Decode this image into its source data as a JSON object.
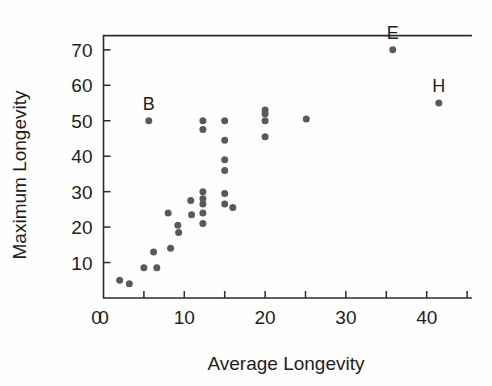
{
  "chart_data": {
    "type": "scatter",
    "title": "",
    "xlabel": "Average Longevity",
    "ylabel": "Maximum Longevity",
    "xlim": [
      0,
      45.5
    ],
    "ylim": [
      0,
      74
    ],
    "grid": false,
    "legend": null,
    "xticks": [
      0,
      5,
      10,
      15,
      20,
      25,
      30,
      35,
      40,
      45
    ],
    "xtick_labels": [
      "0",
      "",
      "10",
      "",
      "20",
      "",
      "30",
      "",
      "40",
      ""
    ],
    "yticks": [
      0,
      10,
      20,
      30,
      40,
      50,
      60,
      70
    ],
    "ytick_labels": [
      "",
      "10",
      "20",
      "30",
      "40",
      "50",
      "60",
      "70"
    ],
    "marker_color": "#5a5a5e",
    "axis_color": "#2b2b2b",
    "points": [
      {
        "x": 2.0,
        "y": 5.0,
        "label": ""
      },
      {
        "x": 3.2,
        "y": 4.0,
        "label": ""
      },
      {
        "x": 5.0,
        "y": 8.5,
        "label": ""
      },
      {
        "x": 5.6,
        "y": 50.0,
        "label": "B"
      },
      {
        "x": 6.6,
        "y": 8.5,
        "label": ""
      },
      {
        "x": 6.2,
        "y": 13.0,
        "label": ""
      },
      {
        "x": 8.3,
        "y": 14.0,
        "label": ""
      },
      {
        "x": 8.0,
        "y": 24.0,
        "label": ""
      },
      {
        "x": 9.2,
        "y": 20.5,
        "label": ""
      },
      {
        "x": 9.3,
        "y": 18.5,
        "label": ""
      },
      {
        "x": 10.8,
        "y": 27.5,
        "label": ""
      },
      {
        "x": 10.9,
        "y": 23.5,
        "label": ""
      },
      {
        "x": 12.3,
        "y": 50.0,
        "label": ""
      },
      {
        "x": 12.3,
        "y": 47.5,
        "label": ""
      },
      {
        "x": 12.3,
        "y": 30.0,
        "label": ""
      },
      {
        "x": 12.3,
        "y": 28.0,
        "label": ""
      },
      {
        "x": 12.3,
        "y": 26.5,
        "label": ""
      },
      {
        "x": 12.3,
        "y": 24.0,
        "label": ""
      },
      {
        "x": 12.3,
        "y": 21.0,
        "label": ""
      },
      {
        "x": 15.0,
        "y": 50.0,
        "label": ""
      },
      {
        "x": 15.0,
        "y": 44.5,
        "label": ""
      },
      {
        "x": 15.0,
        "y": 39.0,
        "label": ""
      },
      {
        "x": 15.0,
        "y": 36.0,
        "label": ""
      },
      {
        "x": 15.0,
        "y": 29.5,
        "label": ""
      },
      {
        "x": 15.0,
        "y": 26.5,
        "label": ""
      },
      {
        "x": 16.0,
        "y": 25.5,
        "label": ""
      },
      {
        "x": 20.0,
        "y": 53.0,
        "label": ""
      },
      {
        "x": 20.0,
        "y": 52.0,
        "label": ""
      },
      {
        "x": 20.0,
        "y": 50.0,
        "label": ""
      },
      {
        "x": 20.0,
        "y": 45.5,
        "label": ""
      },
      {
        "x": 25.1,
        "y": 50.5,
        "label": ""
      },
      {
        "x": 35.8,
        "y": 70.0,
        "label": "E"
      },
      {
        "x": 41.5,
        "y": 55.0,
        "label": "H"
      }
    ]
  },
  "axes": {
    "x_title": "Average Longevity",
    "y_title": "Maximum Longevity"
  }
}
